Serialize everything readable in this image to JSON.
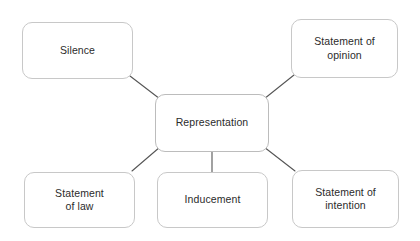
{
  "diagram": {
    "type": "mind-map",
    "background_color": "#ffffff",
    "node_border_color": "#c8c8c8",
    "connector_color": "#555555",
    "text_color": "#2b2b2b",
    "central_node": {
      "label": "Representation",
      "x": 155,
      "y": 94,
      "width": 114,
      "height": 58
    },
    "nodes": [
      {
        "id": "silence",
        "label": "Silence",
        "x": 22,
        "y": 22,
        "width": 111,
        "height": 57
      },
      {
        "id": "statement-of-opinion",
        "label": "Statement of\nopinion",
        "x": 291,
        "y": 19,
        "width": 107,
        "height": 59
      },
      {
        "id": "statement-of-law",
        "label": "Statement\nof law",
        "x": 24,
        "y": 172,
        "width": 111,
        "height": 56
      },
      {
        "id": "inducement",
        "label": "Inducement",
        "x": 157,
        "y": 172,
        "width": 111,
        "height": 56
      },
      {
        "id": "statement-of-intention",
        "label": "Statement of\nintention",
        "x": 292,
        "y": 170,
        "width": 107,
        "height": 58
      }
    ],
    "connectors": [
      {
        "id": "central-to-silence",
        "x1": 160,
        "y1": 99,
        "x2": 130,
        "y2": 76
      },
      {
        "id": "central-to-statement-of-opinion",
        "x1": 264,
        "y1": 99,
        "x2": 294,
        "y2": 75
      },
      {
        "id": "central-to-statement-of-law",
        "x1": 160,
        "y1": 147,
        "x2": 132,
        "y2": 171
      },
      {
        "id": "central-to-inducement",
        "x1": 212,
        "y1": 152,
        "x2": 212,
        "y2": 172
      },
      {
        "id": "central-to-statement-of-intention",
        "x1": 264,
        "y1": 147,
        "x2": 295,
        "y2": 171
      }
    ]
  }
}
